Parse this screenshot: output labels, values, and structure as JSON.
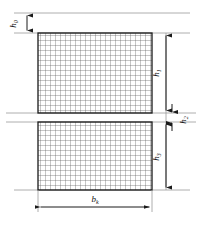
{
  "diagram": {
    "type": "engineering-dimension-drawing",
    "labels": {
      "h0": "h",
      "h0_sub": "0",
      "h1": "h",
      "h1_sub": "1",
      "h2": "h",
      "h2_sub": "2",
      "h3": "h",
      "h3_sub": "3",
      "b": "b",
      "b_sub": "k"
    },
    "colors": {
      "outline": "#1a1a1a",
      "hatch": "#555555",
      "reference_line": "#8a8a8a",
      "dimension_line": "#2a2a2a",
      "background": "#ffffff"
    },
    "geometry": {
      "rect_left": 38,
      "rect_right": 152,
      "upper_top": 33,
      "upper_bottom": 113,
      "lower_top": 122,
      "lower_bottom": 190,
      "hatch_pitch": 5
    },
    "dimensions": {
      "h0_span": [
        13,
        33
      ],
      "h1_span": [
        33,
        113
      ],
      "h2_span": [
        113,
        122
      ],
      "h3_span": [
        122,
        190
      ],
      "b_span": [
        38,
        152
      ]
    }
  }
}
